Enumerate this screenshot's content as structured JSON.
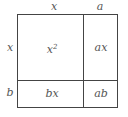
{
  "diagram": {
    "title": "",
    "top_labels": [
      "x",
      "a"
    ],
    "side_labels": [
      "x",
      "b"
    ],
    "cells": {
      "top_left": {
        "base": "x",
        "exponent": "2"
      },
      "top_right": "ax",
      "bottom_left": "bx",
      "bottom_right": "ab"
    },
    "line_color": "#444444",
    "text_color": "#555555"
  }
}
